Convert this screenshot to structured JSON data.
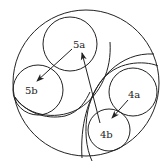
{
  "diagram": {
    "colors": {
      "stroke": "#222222",
      "background": "#ffffff"
    },
    "outer_circle": {
      "cx": 86,
      "cy": 83,
      "r": 73
    },
    "regions": [
      {
        "id": "left-region",
        "circles": [
          {
            "id": "5a",
            "label": "5a",
            "cx": 70,
            "cy": 44,
            "r": 27
          },
          {
            "id": "5b",
            "label": "5b",
            "cx": 38,
            "cy": 90,
            "r": 25
          }
        ]
      },
      {
        "id": "right-region",
        "circles": [
          {
            "id": "4a",
            "label": "4a",
            "cx": 133,
            "cy": 92,
            "r": 24
          },
          {
            "id": "4b",
            "label": "4b",
            "cx": 109,
            "cy": 130,
            "r": 21
          }
        ]
      }
    ],
    "labels": {
      "l5a": "5a",
      "l5b": "5b",
      "l4a": "4a",
      "l4b": "4b"
    },
    "arrows": [
      {
        "from": "5a",
        "to": "5b"
      },
      {
        "from": "4a",
        "to": "4b"
      },
      {
        "from": "4b",
        "to": "5a"
      }
    ]
  }
}
